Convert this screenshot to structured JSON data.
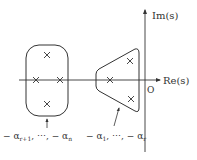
{
  "diagram": {
    "axes": {
      "real_label": "Re(s)",
      "imag_label": "Im(s)",
      "origin_label": "O"
    },
    "groups": [
      {
        "name": "far-poles",
        "shape": "rounded-rectangle",
        "label": "−α_{r+1}, ⋯, −α_n",
        "label_parts": {
          "lead": "− α",
          "sub1": "r+1",
          "mid": ", ⋯, − α",
          "sub2": "n"
        },
        "poles": 4
      },
      {
        "name": "dominant-poles",
        "shape": "trapezoid",
        "label": "−α_1, ⋯, −α_r",
        "label_parts": {
          "lead": "− α",
          "sub1": "1",
          "mid": ", ⋯, − α",
          "sub2": "r"
        },
        "poles": 3
      }
    ],
    "pole_marker": "×",
    "colors": {
      "stroke": "#333333",
      "background": "#ffffff"
    }
  }
}
